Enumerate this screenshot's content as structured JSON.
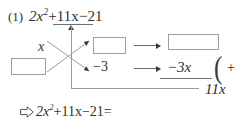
{
  "worksheet": {
    "problem_number": "(1)",
    "expression": {
      "leading_coefficient": "2",
      "variable": "x",
      "exponent": "2",
      "middle_term": "+11x",
      "constant_term": "−21",
      "full_text": "2x²+11x−21"
    },
    "cross_method": {
      "top_left_factor": "x",
      "bottom_left_factor": "",
      "top_right_factor": "",
      "bottom_right_factor": "−3",
      "product_top_box": "",
      "product_result_box": "",
      "bottom_product_term": "−3x",
      "sum_term": "11x",
      "operation_symbol": "+",
      "paren_glyph": "("
    },
    "conclusion": {
      "arrow_icon": "hollow-right-arrow-icon",
      "leading_coefficient": "2",
      "variable": "x",
      "exponent": "2",
      "middle_term": "+11x",
      "constant_term": "−21",
      "equals": "=",
      "full_text": "2x²+11x−21="
    }
  },
  "colors": {
    "text": "#2f2f2f",
    "box_border": "#9e9e9e",
    "line": "#9a9a9a",
    "arrow": "#3a3a3a",
    "background": "#ffffff"
  }
}
